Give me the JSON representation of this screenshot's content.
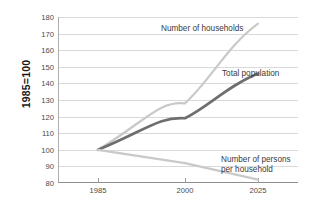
{
  "chart_data": {
    "type": "line",
    "title": "",
    "subtitle": "",
    "xlabel": "",
    "ylabel": "1985=100",
    "x": [
      1985,
      2000,
      2025
    ],
    "x_tick_labels": [
      "1985",
      "2000",
      "2025"
    ],
    "xlim": [
      1985,
      2025
    ],
    "ylim": [
      80,
      180
    ],
    "y_tick_labels": [
      "80",
      "90",
      "100",
      "110",
      "120",
      "130",
      "140",
      "150",
      "160",
      "170",
      "180"
    ],
    "y_ticks": [
      80,
      90,
      100,
      110,
      120,
      130,
      140,
      150,
      160,
      170,
      180
    ],
    "grid": "horizontal",
    "legend": "inline-annotations",
    "series": [
      {
        "name": "Number of households",
        "values": [
          100,
          128,
          176
        ],
        "color": "#c9c9c9",
        "style": "curved",
        "width": 2.2
      },
      {
        "name": "Total population",
        "values": [
          100,
          119,
          146
        ],
        "color": "#6e6e6e",
        "style": "curved",
        "width": 2.6
      },
      {
        "name": "Number of persons per household",
        "values": [
          100,
          92,
          82
        ],
        "color": "#c9c9c9",
        "style": "straight",
        "width": 2.2
      }
    ],
    "annotations": [
      {
        "id": "households",
        "text": "Number of households"
      },
      {
        "id": "population",
        "text": "Total population"
      },
      {
        "id": "persons",
        "text": "Number of persons\nper household"
      }
    ]
  },
  "axis": {
    "y_title": "1985=100",
    "y_ticks": [
      "180",
      "170",
      "160",
      "150",
      "140",
      "130",
      "120",
      "110",
      "100",
      "90",
      "80"
    ],
    "x_ticks": [
      "1985",
      "2000",
      "2025"
    ]
  },
  "annotations": {
    "households": "Number of households",
    "population": "Total population",
    "persons": "Number of persons\nper household"
  },
  "colors": {
    "light_series": "#c9c9c9",
    "dark_series": "#6e6e6e",
    "gridline": "#d9d9d9",
    "axis": "#8e8e8e",
    "text": "#3a3a3a"
  }
}
